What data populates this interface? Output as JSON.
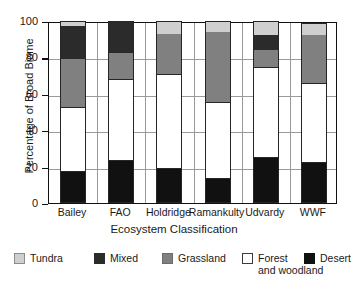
{
  "chart_data": {
    "type": "bar",
    "stacked": true,
    "title": "",
    "xlabel": "Ecosystem Classification",
    "ylabel": "Percentage of Broad Biome",
    "ylim": [
      0,
      100
    ],
    "yticks": [
      0,
      20,
      40,
      60,
      80,
      100
    ],
    "grid": "both",
    "legend_position": "bottom",
    "categories": [
      "Bailey",
      "FAO",
      "Holdridge",
      "Ramankulty",
      "Udvardy",
      "WWF"
    ],
    "series": [
      {
        "name": "Desert",
        "color": "#111111",
        "values": [
          17,
          23,
          18.5,
          13,
          25,
          22
        ]
      },
      {
        "name": "Forest and woodland",
        "color": "#ffffff",
        "values": [
          36,
          45,
          52.5,
          42.5,
          49.5,
          44
        ]
      },
      {
        "name": "Grassland",
        "color": "#808080",
        "values": [
          26,
          14.5,
          22,
          38.5,
          9.5,
          26.5
        ]
      },
      {
        "name": "Mixed",
        "color": "#2b2b2b",
        "values": [
          18,
          17.5,
          0,
          0,
          8.5,
          0
        ]
      },
      {
        "name": "Tundra",
        "color": "#cfcfcf",
        "values": [
          3,
          0,
          7,
          6,
          7.5,
          6.5
        ]
      }
    ],
    "cumulative_tops": {
      "Bailey": {
        "Desert": 17,
        "Forest and woodland": 53,
        "Grassland": 79,
        "Mixed": 97,
        "Tundra": 100
      },
      "FAO": {
        "Desert": 23,
        "Forest and woodland": 68,
        "Grassland": 82.5,
        "Mixed": 100,
        "Tundra": 100
      },
      "Holdridge": {
        "Desert": 18.5,
        "Forest and woodland": 71,
        "Grassland": 93,
        "Mixed": 93,
        "Tundra": 100
      },
      "Ramankulty": {
        "Desert": 13,
        "Forest and woodland": 55.5,
        "Grassland": 94,
        "Mixed": 94,
        "Tundra": 100
      },
      "Udvardy": {
        "Desert": 25,
        "Forest and woodland": 74.5,
        "Grassland": 84,
        "Mixed": 92.5,
        "Tundra": 100
      },
      "WWF": {
        "Desert": 22,
        "Forest and woodland": 66,
        "Grassland": 92.5,
        "Mixed": 92.5,
        "Tundra": 99
      }
    }
  },
  "legend": {
    "items": [
      {
        "label": "Tundra",
        "label_line2": "",
        "color": "#cfcfcf",
        "left": 0,
        "swatch_border": "#8c8c8c"
      },
      {
        "label": "Mixed",
        "label_line2": "",
        "color": "#2b2b2b",
        "left": 80,
        "swatch_border": "#2b2b2b"
      },
      {
        "label": "Grassland",
        "label_line2": "",
        "color": "#808080",
        "left": 148,
        "swatch_border": "#6b6b6b"
      },
      {
        "label": "Forest",
        "label_line2": "and woodland",
        "color": "#ffffff",
        "left": 228,
        "swatch_border": "#3c3c3c"
      },
      {
        "label": "Desert",
        "label_line2": "",
        "color": "#111111",
        "left": 290,
        "swatch_border": "#111111"
      }
    ]
  }
}
